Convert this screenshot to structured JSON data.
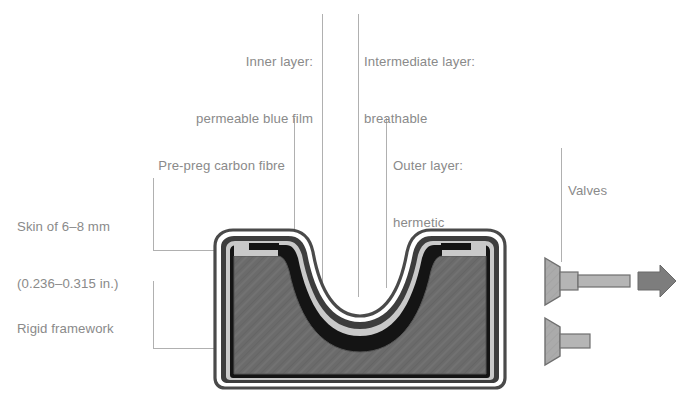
{
  "figure": {
    "type": "cutaway-cross-section-diagram",
    "background_color": "#ffffff",
    "label_text_color": "#8a8a8a",
    "leader_line_color": "#b0b0b0"
  },
  "labels": {
    "inner_layer": {
      "line1": "Inner layer:",
      "line2": "permeable blue film"
    },
    "intermediate_layer": {
      "line1": "Intermediate layer:",
      "line2": "breathable"
    },
    "pre_preg": {
      "line1": "Pre-preg carbon fibre"
    },
    "outer_layer": {
      "line1": "Outer layer:",
      "line2": "hermetic"
    },
    "skin_thickness": {
      "line1": "Skin of 6–8 mm",
      "line2": "(0.236–0.315 in.)"
    },
    "rigid_framework": {
      "line1": "Rigid framework"
    },
    "valves": {
      "line1": "Valves"
    }
  },
  "colors": {
    "hermetic_outer_line": "#4a4a4a",
    "outer_layer_dark": "#3d3d3d",
    "intermediate_light_gray": "#c9c9c9",
    "inner_layer_black": "#141414",
    "rigid_framework_fill": "#6b6b6b",
    "rigid_framework_edge": "#555555",
    "valve_body_fill": "#a8a8a8",
    "valve_stem_fill": "#b5b5b5",
    "valve_edge": "#6f6f6f",
    "flow_arrow": "#7d7d7d",
    "white_gap": "#ffffff"
  },
  "parts": [
    {
      "name": "inner-layer",
      "description": "permeable blue film, innermost black band"
    },
    {
      "name": "intermediate-layer",
      "description": "breathable, light gray band"
    },
    {
      "name": "outer-layer",
      "description": "hermetic, dark band"
    },
    {
      "name": "pre-preg-carbon-fibre",
      "description": "thin dark outline shell"
    },
    {
      "name": "rigid-framework",
      "description": "medium gray hatched core body"
    },
    {
      "name": "valve-upper",
      "description": "upper valve with long stem and flow arrow"
    },
    {
      "name": "valve-lower",
      "description": "lower valve with short stem"
    },
    {
      "name": "flow-arrow",
      "description": "gray right-pointing arrow indicating outflow"
    }
  ]
}
